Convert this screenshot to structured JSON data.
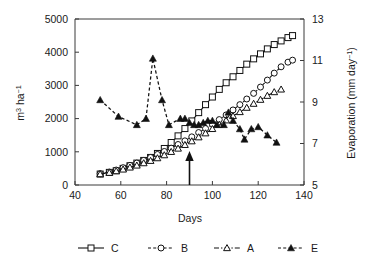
{
  "chart_data": {
    "type": "line",
    "title": "",
    "xlabel": "Days",
    "ylabel": "m3 ha-1",
    "ylabel_display": "m",
    "ylabel_sup1": "3",
    "ylabel_mid": " ha",
    "ylabel_sup2": "−1",
    "y2label_display": "Evaporation (mm day",
    "y2label_sup": "−1",
    "y2label_tail": ")",
    "xlim": [
      40,
      140
    ],
    "ylim": [
      0,
      5000
    ],
    "y2lim": [
      5,
      13
    ],
    "xticks": [
      40,
      60,
      80,
      100,
      120,
      140
    ],
    "yticks": [
      0,
      1000,
      2000,
      3000,
      4000,
      5000
    ],
    "y2ticks": [
      5,
      7,
      9,
      11,
      13
    ],
    "grid": false,
    "legend_position": "below-center",
    "annotations": [
      {
        "name": "up-arrow",
        "x": 90,
        "y_from": 0,
        "y_to": 900,
        "label": ""
      }
    ],
    "series": [
      {
        "name": "C",
        "axis": "left",
        "marker": "open-square",
        "line": "solid",
        "points": [
          [
            51,
            330
          ],
          [
            55,
            380
          ],
          [
            58,
            430
          ],
          [
            61,
            500
          ],
          [
            64,
            580
          ],
          [
            67,
            660
          ],
          [
            70,
            740
          ],
          [
            73,
            830
          ],
          [
            76,
            950
          ],
          [
            79,
            1100
          ],
          [
            82,
            1280
          ],
          [
            85,
            1480
          ],
          [
            88,
            1700
          ],
          [
            91,
            1930
          ],
          [
            94,
            2180
          ],
          [
            97,
            2420
          ],
          [
            100,
            2650
          ],
          [
            103,
            2880
          ],
          [
            106,
            3080
          ],
          [
            109,
            3260
          ],
          [
            112,
            3450
          ],
          [
            115,
            3640
          ],
          [
            118,
            3800
          ],
          [
            121,
            3950
          ],
          [
            124,
            4100
          ],
          [
            127,
            4230
          ],
          [
            130,
            4340
          ],
          [
            133,
            4440
          ],
          [
            135,
            4500
          ]
        ]
      },
      {
        "name": "B",
        "axis": "left",
        "marker": "open-circle",
        "line": "dashed",
        "points": [
          [
            51,
            340
          ],
          [
            55,
            390
          ],
          [
            58,
            450
          ],
          [
            61,
            520
          ],
          [
            64,
            590
          ],
          [
            67,
            660
          ],
          [
            70,
            740
          ],
          [
            73,
            830
          ],
          [
            76,
            920
          ],
          [
            79,
            1010
          ],
          [
            82,
            1110
          ],
          [
            85,
            1220
          ],
          [
            88,
            1330
          ],
          [
            91,
            1450
          ],
          [
            94,
            1580
          ],
          [
            97,
            1700
          ],
          [
            100,
            1830
          ],
          [
            103,
            1970
          ],
          [
            106,
            2110
          ],
          [
            109,
            2260
          ],
          [
            112,
            2420
          ],
          [
            115,
            2590
          ],
          [
            118,
            2760
          ],
          [
            121,
            2950
          ],
          [
            124,
            3160
          ],
          [
            127,
            3370
          ],
          [
            130,
            3560
          ],
          [
            133,
            3700
          ],
          [
            135,
            3760
          ]
        ]
      },
      {
        "name": "A",
        "axis": "left",
        "marker": "open-triangle",
        "line": "dash-dot",
        "points": [
          [
            51,
            330
          ],
          [
            55,
            370
          ],
          [
            58,
            420
          ],
          [
            61,
            470
          ],
          [
            64,
            530
          ],
          [
            67,
            590
          ],
          [
            70,
            660
          ],
          [
            73,
            730
          ],
          [
            76,
            810
          ],
          [
            79,
            900
          ],
          [
            82,
            1000
          ],
          [
            85,
            1100
          ],
          [
            88,
            1210
          ],
          [
            91,
            1320
          ],
          [
            94,
            1440
          ],
          [
            97,
            1560
          ],
          [
            100,
            1690
          ],
          [
            103,
            1820
          ],
          [
            106,
            1950
          ],
          [
            109,
            2080
          ],
          [
            112,
            2200
          ],
          [
            115,
            2330
          ],
          [
            118,
            2450
          ],
          [
            121,
            2570
          ],
          [
            124,
            2690
          ],
          [
            127,
            2800
          ],
          [
            130,
            2880
          ]
        ]
      },
      {
        "name": "E",
        "axis": "right",
        "marker": "filled-triangle",
        "line": "dashed",
        "points": [
          [
            51,
            9.1
          ],
          [
            59,
            8.3
          ],
          [
            67,
            7.9
          ],
          [
            71,
            8.2
          ],
          [
            74,
            11.1
          ],
          [
            78,
            9.1
          ],
          [
            81,
            7.9
          ],
          [
            86,
            8.2
          ],
          [
            88,
            8.2
          ],
          [
            90,
            8.0
          ],
          [
            92,
            7.9
          ],
          [
            94,
            7.9
          ],
          [
            96,
            8.0
          ],
          [
            98,
            8.1
          ],
          [
            100,
            8.1
          ],
          [
            102,
            7.9
          ],
          [
            105,
            7.9
          ],
          [
            107,
            8.5
          ],
          [
            109,
            8.1
          ],
          [
            112,
            7.7
          ],
          [
            114,
            7.2
          ],
          [
            117,
            7.7
          ],
          [
            120,
            7.8
          ],
          [
            124,
            7.4
          ],
          [
            128,
            7.05
          ]
        ]
      }
    ],
    "legend": [
      {
        "label": "C",
        "marker": "open-square",
        "line": "solid"
      },
      {
        "label": "B",
        "marker": "open-circle",
        "line": "dashed"
      },
      {
        "label": "A",
        "marker": "open-triangle",
        "line": "dash-dot"
      },
      {
        "label": "E",
        "marker": "filled-triangle",
        "line": "dashed"
      }
    ],
    "colors": {
      "axis": "#3a3a3a",
      "line": "#111111",
      "marker_fill": "#ffffff",
      "background": "#ffffff"
    }
  }
}
